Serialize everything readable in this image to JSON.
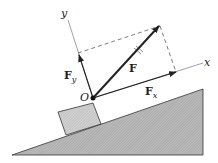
{
  "diagram": {
    "type": "force-decomposition-on-incline",
    "labels": {
      "origin": "O",
      "x_axis": "x",
      "y_axis": "y",
      "force": "F",
      "force_x": "F",
      "force_x_sub": "x",
      "force_y": "F",
      "force_y_sub": "y"
    },
    "colors": {
      "ink": "#222222",
      "incline_fill": "#b0b0b0",
      "block_fill": "#c8c8c8",
      "axis": "#777777"
    }
  }
}
